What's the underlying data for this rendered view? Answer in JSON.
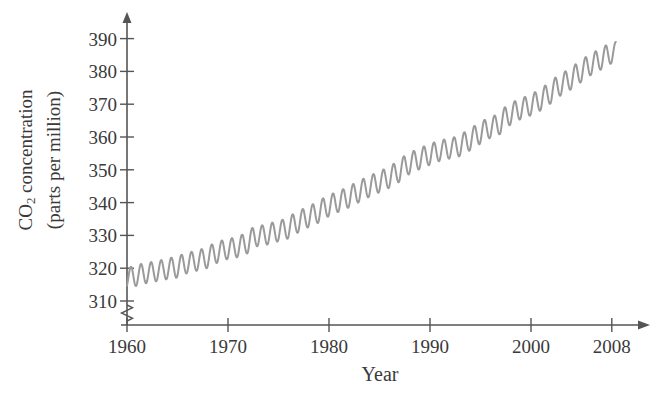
{
  "chart_data": {
    "type": "line",
    "title": "",
    "subtitle": "",
    "xlabel": "Year",
    "ylabel_line1": "CO",
    "ylabel_sub": "2",
    "ylabel_line1_rest": " concentration",
    "ylabel_line2": "(parts per million)",
    "ylabel_full": "CO2 concentration (parts per million)",
    "xlim": [
      1960,
      2009
    ],
    "ylim": [
      305,
      393
    ],
    "y_axis_break": true,
    "grid": false,
    "legend": "none",
    "xticks": [
      1960,
      1970,
      1980,
      1990,
      2000,
      2008
    ],
    "xtick_labels": [
      "1960",
      "1970",
      "1980",
      "1990",
      "2000",
      "2008"
    ],
    "yticks": [
      310,
      320,
      330,
      340,
      350,
      360,
      370,
      380,
      390
    ],
    "ytick_labels": [
      "310",
      "320",
      "330",
      "340",
      "350",
      "360",
      "370",
      "380",
      "390"
    ],
    "series": [
      {
        "name": "Mauna Loa CO2 monthly mean",
        "color": "#9a9a9a",
        "line_width": 2,
        "x": [
          1960.0,
          1960.5,
          1961.0,
          1961.5,
          1962.0,
          1962.5,
          1963.0,
          1963.5,
          1964.0,
          1964.5,
          1965.0,
          1965.5,
          1966.0,
          1966.5,
          1967.0,
          1967.5,
          1968.0,
          1968.5,
          1969.0,
          1969.5,
          1970.0,
          1970.5,
          1971.0,
          1971.5,
          1972.0,
          1972.5,
          1973.0,
          1973.5,
          1974.0,
          1974.5,
          1975.0,
          1975.5,
          1976.0,
          1976.5,
          1977.0,
          1977.5,
          1978.0,
          1978.5,
          1979.0,
          1979.5,
          1980.0,
          1980.5,
          1981.0,
          1981.5,
          1982.0,
          1982.5,
          1983.0,
          1983.5,
          1984.0,
          1984.5,
          1985.0,
          1985.5,
          1986.0,
          1986.5,
          1987.0,
          1987.5,
          1988.0,
          1988.5,
          1989.0,
          1989.5,
          1990.0,
          1990.5,
          1991.0,
          1991.5,
          1992.0,
          1992.5,
          1993.0,
          1993.5,
          1994.0,
          1994.5,
          1995.0,
          1995.5,
          1996.0,
          1996.5,
          1997.0,
          1997.5,
          1998.0,
          1998.5,
          1999.0,
          1999.5,
          2000.0,
          2000.5,
          2001.0,
          2001.5,
          2002.0,
          2002.5,
          2003.0,
          2003.5,
          2004.0,
          2004.5,
          2005.0,
          2005.5,
          2006.0,
          2006.5,
          2007.0,
          2007.5,
          2008.0,
          2008.4
        ],
        "y_annual_mean": [
          316.9,
          317.6,
          317.6,
          318.5,
          318.4,
          319.0,
          319.0,
          319.6,
          319.6,
          320.4,
          320.0,
          321.4,
          321.4,
          322.2,
          322.2,
          323.0,
          323.0,
          324.6,
          324.6,
          325.7,
          325.7,
          326.3,
          326.3,
          327.5,
          327.5,
          329.7,
          329.7,
          330.2,
          330.2,
          331.1,
          331.1,
          332.0,
          332.0,
          333.8,
          333.8,
          335.4,
          335.4,
          336.8,
          336.8,
          338.7,
          338.7,
          340.1,
          340.1,
          341.4,
          341.4,
          343.0,
          343.0,
          344.6,
          344.6,
          346.0,
          346.0,
          347.4,
          347.4,
          349.2,
          349.2,
          351.6,
          351.6,
          353.1,
          353.1,
          354.4,
          354.4,
          355.6,
          355.6,
          356.4,
          356.4,
          357.1,
          357.1,
          358.8,
          358.8,
          360.8,
          360.8,
          362.6,
          362.6,
          363.8,
          363.8,
          366.6,
          366.6,
          368.3,
          368.3,
          369.5,
          369.5,
          371.0,
          371.0,
          373.1,
          373.1,
          375.6,
          375.6,
          377.4,
          377.4,
          379.6,
          379.6,
          381.8,
          381.8,
          383.5,
          383.5,
          385.3,
          385.3,
          386.0
        ],
        "seasonal_amplitude_ppm": 6.0,
        "start_value_ppm": 315.0,
        "end_value_ppm": 385.6,
        "description": "Monthly mean atmospheric CO2 showing a rising trend with an annual sawtooth oscillation"
      }
    ],
    "axes": {
      "y_arrow": true,
      "x_arrow": true,
      "axis_color": "#555555",
      "tick_color": "#555555"
    }
  },
  "figure": {
    "background_color": "#ffffff",
    "curve_color": "#9a9a9a",
    "text_color": "#3a3a3a"
  }
}
